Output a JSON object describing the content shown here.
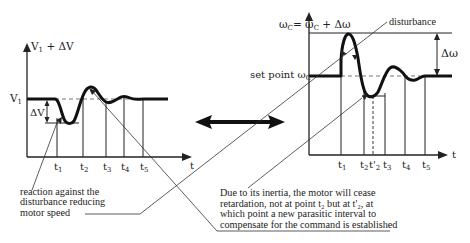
{
  "left_chart": {
    "y_axis_label": "V",
    "y_axis_label_sub": "1",
    "y_axis_label_suffix": " + ΔV",
    "level_label": "V",
    "level_label_sub": "1",
    "delta_label": "ΔV",
    "x_axis_label": "t",
    "ticks": [
      {
        "main": "t",
        "sub": "1"
      },
      {
        "main": "t",
        "sub": "2"
      },
      {
        "main": "t",
        "sub": "3"
      },
      {
        "main": "t",
        "sub": "4"
      },
      {
        "main": "t",
        "sub": "5"
      }
    ]
  },
  "right_chart": {
    "y_axis_label_a": "ω",
    "y_axis_label_a_sub": "C",
    "y_axis_label_eq": "= ω",
    "y_axis_label_b_sub": "C",
    "y_axis_label_suffix": " + Δω",
    "setpoint_label": "set point  ω",
    "setpoint_label_sub": "C",
    "delta_label": "Δω",
    "x_axis_label": "t",
    "disturbance_label": "disturbance",
    "ticks": [
      {
        "main": "t",
        "sub": "1"
      },
      {
        "main": "t",
        "sub": "2"
      },
      {
        "main": "t'",
        "sub": "2"
      },
      {
        "main": "t",
        "sub": "3"
      },
      {
        "main": "t",
        "sub": "4"
      },
      {
        "main": "t",
        "sub": "5"
      }
    ]
  },
  "annotations": {
    "left_note": [
      "reaction against the",
      "disturbance reducing",
      "motor speed"
    ],
    "right_note": [
      "Due to its inertia, the motor will cease",
      "retardation, not at point t₂ but at t'₂, at",
      "which point a new parasitic interval to",
      "compensate for the command is established"
    ]
  },
  "colors": {
    "ink": "#222222",
    "background": "#ffffff"
  }
}
